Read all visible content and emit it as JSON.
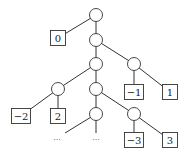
{
  "diagram": {
    "type": "tree",
    "nodes": [
      {
        "id": "n0",
        "kind": "internal"
      },
      {
        "id": "n1",
        "kind": "internal"
      },
      {
        "id": "n2",
        "kind": "internal"
      },
      {
        "id": "n3",
        "kind": "internal"
      },
      {
        "id": "n4",
        "kind": "internal"
      },
      {
        "id": "n5",
        "kind": "internal"
      },
      {
        "id": "n6",
        "kind": "internal"
      },
      {
        "id": "n7",
        "kind": "internal"
      },
      {
        "id": "L0",
        "kind": "leaf",
        "label": "0"
      },
      {
        "id": "Lm1",
        "kind": "leaf",
        "label": "−1"
      },
      {
        "id": "L1",
        "kind": "leaf",
        "label": "1"
      },
      {
        "id": "Lm2",
        "kind": "leaf",
        "label": "−2"
      },
      {
        "id": "L2",
        "kind": "leaf",
        "label": "2"
      },
      {
        "id": "Lm3",
        "kind": "leaf",
        "label": "−3"
      },
      {
        "id": "L3",
        "kind": "leaf",
        "label": "3"
      },
      {
        "id": "D1",
        "kind": "ellipsis",
        "label": "···"
      },
      {
        "id": "D2",
        "kind": "ellipsis",
        "label": "···"
      }
    ],
    "edges": [
      [
        "n0",
        "L0"
      ],
      [
        "n0",
        "n1"
      ],
      [
        "n1",
        "n2"
      ],
      [
        "n1",
        "n3"
      ],
      [
        "n3",
        "Lm1"
      ],
      [
        "n3",
        "L1"
      ],
      [
        "n2",
        "n4"
      ],
      [
        "n2",
        "n5"
      ],
      [
        "n4",
        "Lm2"
      ],
      [
        "n4",
        "L2"
      ],
      [
        "n5",
        "n6"
      ],
      [
        "n5",
        "n7"
      ],
      [
        "n6",
        "D1"
      ],
      [
        "n6",
        "D2"
      ],
      [
        "n7",
        "Lm3"
      ],
      [
        "n7",
        "L3"
      ]
    ]
  }
}
